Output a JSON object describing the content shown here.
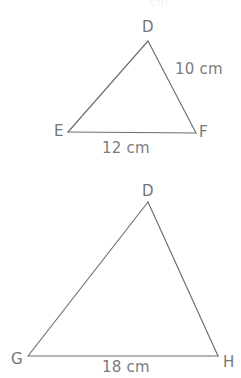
{
  "figure": {
    "background_color": "#ffffff",
    "stroke_color": "#6d6d6d",
    "text_color": "#767676",
    "partial_top_text": "cm",
    "triangles": [
      {
        "id": "triangle-def",
        "vertices": [
          {
            "name": "D",
            "label": "D",
            "x": 148,
            "y": 41,
            "label_x": 142,
            "label_y": 20
          },
          {
            "name": "E",
            "label": "E",
            "x": 68,
            "y": 132,
            "label_x": 54,
            "label_y": 124
          },
          {
            "name": "F",
            "label": "F",
            "x": 196,
            "y": 133,
            "label_x": 199,
            "label_y": 125
          }
        ],
        "sides": [
          {
            "id": "side-df",
            "from": "D",
            "to": "F",
            "label": "10 cm",
            "label_x": 175,
            "label_y": 62
          },
          {
            "id": "side-ef",
            "from": "E",
            "to": "F",
            "label": "12 cm",
            "label_x": 102,
            "label_y": 141
          }
        ]
      },
      {
        "id": "triangle-dgh",
        "vertices": [
          {
            "name": "D",
            "label": "D",
            "x": 148,
            "y": 202,
            "label_x": 142,
            "label_y": 184
          },
          {
            "name": "G",
            "label": "G",
            "x": 28,
            "y": 356,
            "label_x": 11,
            "label_y": 352
          },
          {
            "name": "H",
            "label": "H",
            "x": 218,
            "y": 356,
            "label_x": 223,
            "label_y": 355
          }
        ],
        "sides": [
          {
            "id": "side-gh",
            "from": "G",
            "to": "H",
            "label": "18 cm",
            "label_x": 102,
            "label_y": 360
          }
        ]
      }
    ]
  },
  "labels": {
    "d_top": "D",
    "e": "E",
    "f": "F",
    "ten_cm": "10 cm",
    "twelve_cm": "12 cm",
    "d_bottom": "D",
    "g": "G",
    "h": "H",
    "eighteen_cm": "18 cm",
    "cut_top": "cm"
  }
}
